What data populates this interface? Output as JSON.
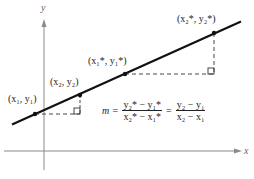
{
  "diagram": {
    "axes": {
      "x_label": "x",
      "y_label": "y"
    },
    "points": [
      {
        "id": "p1",
        "label": "(x1, y1)",
        "px": 35,
        "py": 114
      },
      {
        "id": "p2",
        "label": "(x2, y2)",
        "px": 80,
        "py": 95
      },
      {
        "id": "p1s",
        "label": "(x1*, y1*)",
        "px": 125,
        "py": 74
      },
      {
        "id": "p2s",
        "label": "(x2*, y2*)",
        "px": 214,
        "py": 33
      }
    ],
    "labels": {
      "p1": "(x₁, y₁)",
      "p2": "(x₂, y₂)",
      "p1s": "(x₁*, y₁*)",
      "p2s": "(x₂*, y₂*)"
    },
    "formula": {
      "lhs": "m =",
      "frac1_num": "y₂* − y₁*",
      "frac1_den": "x₂* − x₁*",
      "eq": "=",
      "frac2_num": "y₂ − y₁",
      "frac2_den": "x₂ − x₁"
    },
    "colors": {
      "line": "#111111",
      "axis": "#888888",
      "dash": "#333333"
    }
  }
}
